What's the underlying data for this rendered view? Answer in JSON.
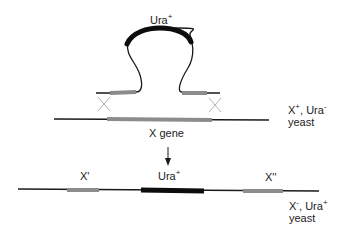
{
  "colors": {
    "background": "#ffffff",
    "line": "#1a1a1a",
    "homology_segment": "#8c8c8c",
    "ura_segment": "#0d0d0d",
    "crossover": "#b4b4b4",
    "text": "#222222"
  },
  "top_construct": {
    "marker_label": "Ura",
    "marker_superscript": "+"
  },
  "chromosome_before": {
    "gene_label": "X gene",
    "genotype_line1_a": "X",
    "genotype_line1_a_sup": "+",
    "genotype_line1_sep": ", ",
    "genotype_line1_b": "Ura",
    "genotype_line1_b_sup": "-",
    "genotype_line2": "yeast"
  },
  "chromosome_after": {
    "left_fragment_label": "X'",
    "marker_label": "Ura",
    "marker_superscript": "+",
    "right_fragment_label": "X''",
    "genotype_line1_a": "X",
    "genotype_line1_a_sup": "-",
    "genotype_line1_sep": ", ",
    "genotype_line1_b": "Ura",
    "genotype_line1_b_sup": "+",
    "genotype_line2": "yeast"
  },
  "icons": {
    "crossover": "x-crossover-icon",
    "arrow": "down-arrow-icon"
  }
}
